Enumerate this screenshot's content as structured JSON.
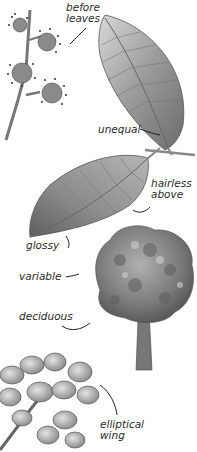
{
  "illustration": {
    "panels": [
      {
        "name": "flowers",
        "label": "before\nleaves"
      },
      {
        "name": "leaf-upper",
        "label": "unequal"
      },
      {
        "name": "leaf-lower",
        "label_right": "hairless\nabove",
        "label_left": "glossy"
      },
      {
        "name": "tree",
        "labels": [
          "variable",
          "deciduous"
        ]
      },
      {
        "name": "fruit",
        "label": "elliptical\nwing"
      }
    ]
  },
  "labels": {
    "before_leaves": "before\nleaves",
    "unequal": "unequal",
    "hairless_above": "hairless\nabove",
    "glossy": "glossy",
    "variable": "variable",
    "deciduous": "deciduous",
    "elliptical_wing": "elliptical\nwing"
  },
  "colors": {
    "ink": "#2a2a2a",
    "leaf_dark": "#6e6e6e",
    "leaf_light": "#c9c9c9",
    "background": "#ffffff"
  }
}
